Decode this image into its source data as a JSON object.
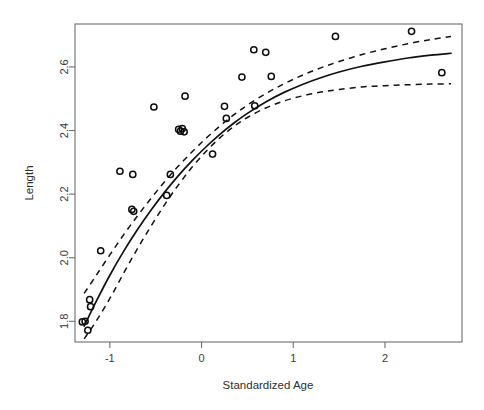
{
  "figure": {
    "background_color": "#ffffff",
    "foreground_color": "#111111",
    "axis_color": "#6e6e6e"
  },
  "axes": {
    "x_title": "Standardized Age",
    "y_title": "Length",
    "x_tick_labels": [
      "-1",
      "0",
      "1",
      "2"
    ],
    "y_tick_labels": [
      "1.8",
      "2.0",
      "2.2",
      "2.4",
      "2.6"
    ]
  },
  "chart_data": {
    "type": "scatter",
    "title": "",
    "subtitle": "",
    "xlabel": "Standardized Age",
    "ylabel": "Length",
    "xlim": [
      -1.38,
      2.84
    ],
    "ylim": [
      1.735,
      2.735
    ],
    "xticks": [
      -1,
      0,
      1,
      2
    ],
    "yticks": [
      1.8,
      2.0,
      2.2,
      2.4,
      2.6
    ],
    "grid": false,
    "legend": null,
    "legend_position": "none",
    "marker": "open-circle",
    "points": [
      {
        "x": -1.3,
        "y": 1.798
      },
      {
        "x": -1.27,
        "y": 1.8
      },
      {
        "x": -1.24,
        "y": 1.772
      },
      {
        "x": -1.22,
        "y": 1.868
      },
      {
        "x": -1.21,
        "y": 1.846
      },
      {
        "x": -1.1,
        "y": 2.022
      },
      {
        "x": -0.89,
        "y": 2.272
      },
      {
        "x": -0.75,
        "y": 2.262
      },
      {
        "x": -0.76,
        "y": 2.152
      },
      {
        "x": -0.74,
        "y": 2.146
      },
      {
        "x": -0.52,
        "y": 2.474
      },
      {
        "x": -0.38,
        "y": 2.196
      },
      {
        "x": -0.34,
        "y": 2.262
      },
      {
        "x": -0.25,
        "y": 2.404
      },
      {
        "x": -0.23,
        "y": 2.398
      },
      {
        "x": -0.21,
        "y": 2.406
      },
      {
        "x": -0.18,
        "y": 2.508
      },
      {
        "x": -0.19,
        "y": 2.396
      },
      {
        "x": 0.12,
        "y": 2.326
      },
      {
        "x": 0.25,
        "y": 2.476
      },
      {
        "x": 0.27,
        "y": 2.438
      },
      {
        "x": 0.44,
        "y": 2.568
      },
      {
        "x": 0.57,
        "y": 2.654
      },
      {
        "x": 0.58,
        "y": 2.478
      },
      {
        "x": 0.7,
        "y": 2.646
      },
      {
        "x": 0.76,
        "y": 2.57
      },
      {
        "x": 1.46,
        "y": 2.696
      },
      {
        "x": 2.29,
        "y": 2.712
      },
      {
        "x": 2.62,
        "y": 2.582
      }
    ],
    "series": [
      {
        "name": "fitted-curve",
        "style": "solid",
        "x": [
          -1.28,
          -1.15,
          -1.0,
          -0.85,
          -0.7,
          -0.55,
          -0.4,
          -0.25,
          -0.1,
          0.05,
          0.2,
          0.35,
          0.5,
          0.7,
          0.9,
          1.1,
          1.3,
          1.5,
          1.75,
          2.0,
          2.25,
          2.5,
          2.72
        ],
        "y": [
          1.785,
          1.862,
          1.945,
          2.02,
          2.088,
          2.15,
          2.207,
          2.259,
          2.306,
          2.349,
          2.388,
          2.423,
          2.454,
          2.49,
          2.52,
          2.545,
          2.566,
          2.584,
          2.602,
          2.616,
          2.628,
          2.637,
          2.643
        ]
      },
      {
        "name": "upper-confidence-band",
        "style": "dashed",
        "x": [
          -1.28,
          -1.15,
          -1.0,
          -0.85,
          -0.7,
          -0.55,
          -0.4,
          -0.25,
          -0.1,
          0.05,
          0.2,
          0.35,
          0.5,
          0.7,
          0.9,
          1.1,
          1.3,
          1.5,
          1.75,
          2.0,
          2.25,
          2.5,
          2.72
        ],
        "y": [
          1.888,
          1.944,
          2.009,
          2.072,
          2.131,
          2.187,
          2.24,
          2.289,
          2.334,
          2.376,
          2.414,
          2.449,
          2.48,
          2.516,
          2.547,
          2.574,
          2.597,
          2.617,
          2.639,
          2.657,
          2.673,
          2.686,
          2.696
        ]
      },
      {
        "name": "lower-confidence-band",
        "style": "dashed",
        "x": [
          -1.28,
          -1.15,
          -1.0,
          -0.85,
          -0.7,
          -0.55,
          -0.4,
          -0.25,
          -0.1,
          0.05,
          0.2,
          0.35,
          0.5,
          0.7,
          0.9,
          1.1,
          1.3,
          1.5,
          1.75,
          2.0,
          2.25,
          2.5,
          2.72
        ],
        "y": [
          1.745,
          1.8,
          1.872,
          1.951,
          2.028,
          2.1,
          2.168,
          2.23,
          2.286,
          2.335,
          2.377,
          2.412,
          2.441,
          2.471,
          2.493,
          2.509,
          2.521,
          2.529,
          2.537,
          2.541,
          2.544,
          2.546,
          2.547
        ]
      }
    ]
  }
}
